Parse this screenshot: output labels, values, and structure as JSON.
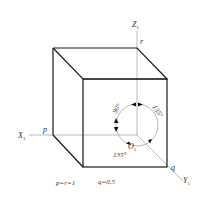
{
  "diagram": {
    "axes": {
      "z": {
        "label": "Z",
        "subscript": "1"
      },
      "x": {
        "label": "X",
        "subscript": "1"
      },
      "y": {
        "label": "Y",
        "subscript": "1"
      },
      "origin": {
        "label": "O",
        "subscript": "1"
      }
    },
    "points": {
      "p": "p",
      "q": "q",
      "r": "r"
    },
    "angles": {
      "xz": "90°",
      "zy": "135°",
      "xy": "135°"
    },
    "coefficients": {
      "pr": "p=r=1",
      "q": "q=0.5"
    },
    "colors": {
      "cube_edge": "#1a1a1a",
      "axis": "#a8a8a8",
      "circle": "#b0b0b0",
      "arrow": "#111111",
      "text": "#333333"
    }
  }
}
